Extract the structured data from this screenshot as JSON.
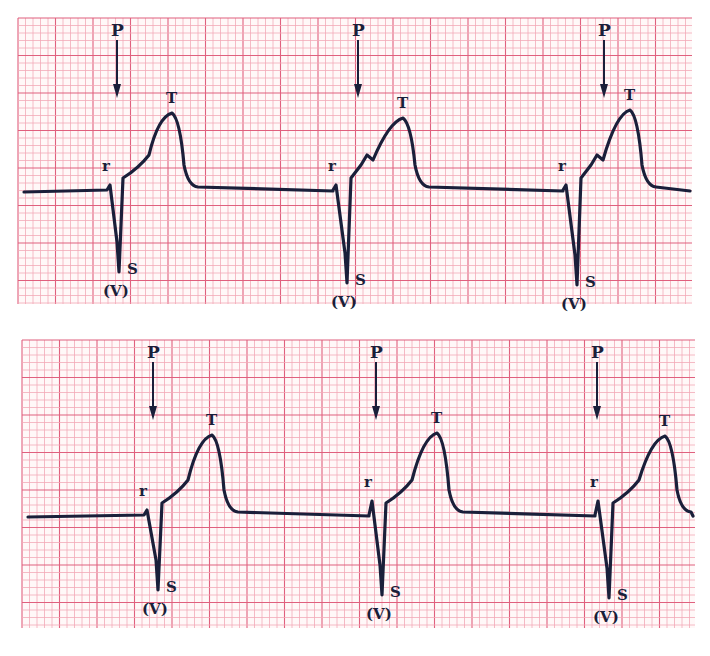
{
  "chart_data": [
    {
      "type": "line",
      "title": "",
      "xlabel": "",
      "ylabel": "",
      "grid": true,
      "strip": "top",
      "baseline_y": 190,
      "beats": [
        {
          "p_x": 117,
          "r_x": 110,
          "s_x": 119,
          "s_y": 272,
          "t_x": 172,
          "t_y": 113,
          "notch": false
        },
        {
          "p_x": 358,
          "r_x": 336,
          "s_x": 347,
          "s_y": 283,
          "t_x": 403,
          "t_y": 118,
          "notch": true
        },
        {
          "p_x": 604,
          "r_x": 566,
          "s_x": 577,
          "s_y": 285,
          "t_x": 630,
          "t_y": 110,
          "notch": true
        }
      ],
      "wave_labels": [
        "P",
        "r",
        "T",
        "S",
        "(V)"
      ]
    },
    {
      "type": "line",
      "title": "",
      "xlabel": "",
      "ylabel": "",
      "grid": true,
      "strip": "bottom",
      "baseline_y": 515,
      "beats": [
        {
          "p_x": 153,
          "r_x": 147,
          "s_x": 158,
          "s_y": 590,
          "t_x": 212,
          "t_y": 435,
          "notch": false
        },
        {
          "p_x": 376,
          "r_x": 372,
          "s_x": 382,
          "s_y": 595,
          "t_x": 437,
          "t_y": 433,
          "notch": false
        },
        {
          "p_x": 597,
          "r_x": 598,
          "s_x": 609,
          "s_y": 598,
          "t_x": 665,
          "t_y": 436,
          "notch": false
        }
      ],
      "wave_labels": [
        "P",
        "r",
        "T",
        "S",
        "(V)"
      ]
    }
  ],
  "labels": {
    "p": "P",
    "r": "r",
    "t": "T",
    "s": "S",
    "v": "(V)"
  },
  "colors": {
    "grid_minor": "#f2a9b8",
    "grid_major": "#e0607e",
    "trace": "#1a1f3a",
    "paper": "#fff8f8"
  },
  "strips": [
    {
      "x": 18,
      "y": 18,
      "w": 674,
      "h": 286
    },
    {
      "x": 22,
      "y": 340,
      "w": 673,
      "h": 288
    }
  ]
}
